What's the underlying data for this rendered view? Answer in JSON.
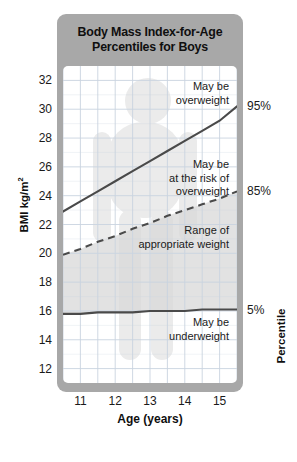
{
  "title": {
    "line1": "Body Mass Index-for-Age",
    "line2": "Percentiles for Boys"
  },
  "axes": {
    "y_title": "BMI kg/m",
    "y_title_exponent": "2",
    "x_title": "Age (years)",
    "right_title": "Percentile"
  },
  "percentile_labels": {
    "p95": "95%",
    "p85": "85%",
    "p5": "5%"
  },
  "zones": {
    "overweight_l1": "May be",
    "overweight_l2": "overweight",
    "risk_l1": "May be",
    "risk_l2": "at the risk of",
    "risk_l3": "overweight",
    "range_l1": "Range of",
    "range_l2": "appropriate weight",
    "under_l1": "May be",
    "under_l2": "underweight"
  },
  "colors": {
    "card_gray": "#a8a8a8",
    "plot_bg": "#ffffff",
    "band_shade": "#d8d8d8",
    "grid": "#c9d4e0",
    "curve": "#4a4a4a",
    "text": "#1a1a1a",
    "silhouette": "#ebebeb"
  },
  "chart_data": {
    "type": "line",
    "title": "Body Mass Index-for-Age Percentiles for Boys",
    "xlabel": "Age (years)",
    "ylabel": "BMI kg/m2",
    "xlim": [
      10.5,
      15.5
    ],
    "ylim": [
      11,
      33
    ],
    "yticks": [
      32,
      30,
      28,
      26,
      24,
      22,
      20,
      18,
      16,
      14,
      12
    ],
    "xticks": [
      11,
      12,
      13,
      14,
      15
    ],
    "grid": true,
    "legend_position": "right-axis-callouts",
    "x": [
      10.5,
      11,
      11.5,
      12,
      12.5,
      13,
      13.5,
      14,
      14.5,
      15,
      15.5
    ],
    "series": [
      {
        "name": "95%",
        "style": "solid",
        "values": [
          22.9,
          23.6,
          24.3,
          25.0,
          25.7,
          26.4,
          27.1,
          27.8,
          28.5,
          29.2,
          30.2
        ]
      },
      {
        "name": "85%",
        "style": "dashed",
        "values": [
          19.9,
          20.3,
          20.8,
          21.2,
          21.7,
          22.1,
          22.6,
          23.0,
          23.4,
          23.8,
          24.3
        ]
      },
      {
        "name": "5%",
        "style": "solid",
        "values": [
          15.8,
          15.8,
          15.9,
          15.9,
          15.9,
          16.0,
          16.0,
          16.0,
          16.1,
          16.1,
          16.1
        ]
      }
    ],
    "annotations": [
      {
        "text": "May be overweight",
        "region": "above 95th percentile"
      },
      {
        "text": "May be at the risk of overweight",
        "region": "between 85th and 95th percentile"
      },
      {
        "text": "Range of appropriate weight",
        "region": "between 5th and 85th percentile"
      },
      {
        "text": "May be underweight",
        "region": "below 5th percentile"
      }
    ]
  }
}
